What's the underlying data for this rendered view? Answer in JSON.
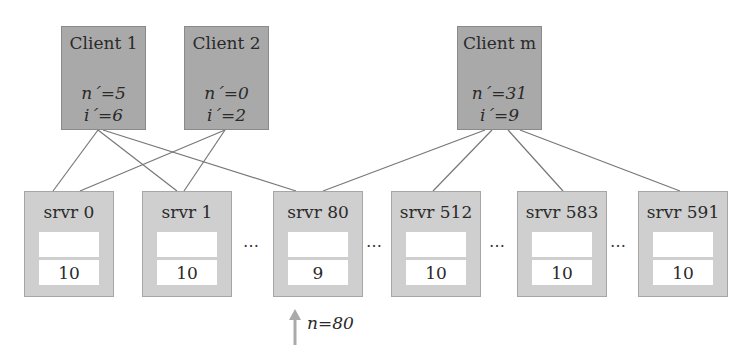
{
  "diagram": {
    "clients": [
      {
        "id": "client-1",
        "title": "Client 1",
        "n_prime_label": "n´=5",
        "i_prime_label": "i´=6",
        "x": 61
      },
      {
        "id": "client-2",
        "title": "Client 2",
        "n_prime_label": "n´=0",
        "i_prime_label": "i´=2",
        "x": 184
      },
      {
        "id": "client-m",
        "title": "Client m",
        "n_prime_label": "n´=31",
        "i_prime_label": "i´=9",
        "x": 457
      }
    ],
    "servers": [
      {
        "id": "srvr-0",
        "title": "srvr 0",
        "top_slot": "",
        "bottom_slot": "10",
        "x": 24
      },
      {
        "id": "srvr-1",
        "title": "srvr 1",
        "top_slot": "",
        "bottom_slot": "10",
        "x": 142
      },
      {
        "id": "srvr-80",
        "title": "srvr 80",
        "top_slot": "",
        "bottom_slot": "9",
        "x": 273
      },
      {
        "id": "srvr-512",
        "title": "srvr 512",
        "top_slot": "",
        "bottom_slot": "10",
        "x": 391
      },
      {
        "id": "srvr-583",
        "title": "srvr 583",
        "top_slot": "",
        "bottom_slot": "10",
        "x": 517
      },
      {
        "id": "srvr-591",
        "title": "srvr 591",
        "top_slot": "",
        "bottom_slot": "10",
        "x": 638
      }
    ],
    "ellipses": [
      {
        "text": "…",
        "x": 243
      },
      {
        "text": "…",
        "x": 366
      },
      {
        "text": "…",
        "x": 489
      },
      {
        "text": "…",
        "x": 610
      }
    ],
    "links": [
      {
        "from": "Client 1",
        "to": "srvr 0",
        "x1": 98,
        "y1": 130,
        "x2": 53,
        "y2": 191
      },
      {
        "from": "Client 1",
        "to": "srvr 1",
        "x1": 98,
        "y1": 130,
        "x2": 177,
        "y2": 191
      },
      {
        "from": "Client 1",
        "to": "srvr 80",
        "x1": 103,
        "y1": 130,
        "x2": 296,
        "y2": 191
      },
      {
        "from": "Client 2",
        "to": "srvr 0",
        "x1": 225,
        "y1": 130,
        "x2": 80,
        "y2": 191
      },
      {
        "from": "Client 2",
        "to": "srvr 1",
        "x1": 225,
        "y1": 130,
        "x2": 184,
        "y2": 191
      },
      {
        "from": "Client m",
        "to": "srvr 80",
        "x1": 485,
        "y1": 130,
        "x2": 323,
        "y2": 191
      },
      {
        "from": "Client m",
        "to": "srvr 512",
        "x1": 492,
        "y1": 130,
        "x2": 433,
        "y2": 191
      },
      {
        "from": "Client m",
        "to": "srvr 583",
        "x1": 508,
        "y1": 130,
        "x2": 563,
        "y2": 191
      },
      {
        "from": "Client m",
        "to": "srvr 591",
        "x1": 520,
        "y1": 130,
        "x2": 680,
        "y2": 191
      }
    ],
    "pointer": {
      "label": "n=80",
      "target": "srvr 80"
    },
    "colors": {
      "client_fill": "#a9a9a9",
      "server_fill": "#cfcfcf",
      "line": "#777777",
      "arrow": "#aaaaaa"
    }
  }
}
